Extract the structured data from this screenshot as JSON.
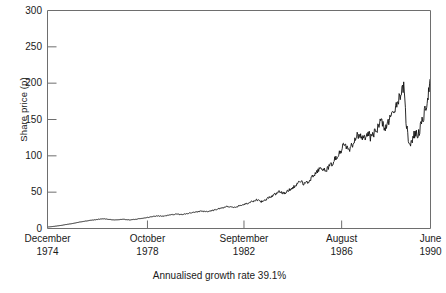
{
  "chart_data": {
    "type": "line",
    "title": "",
    "subtitle": "",
    "xlabel": "",
    "ylabel": "Share price (p)",
    "annotation": "Annualised growth rate 39.1%",
    "grid": false,
    "legend": "none",
    "ylim": [
      0,
      300
    ],
    "yticks": [
      0,
      50,
      100,
      150,
      200,
      250,
      300
    ],
    "ytick_labels": [
      "0",
      "50",
      "100",
      "150",
      "200",
      "250",
      "300"
    ],
    "xlim": [
      "December 1974",
      "June 1990"
    ],
    "xticks": [
      {
        "month": "December",
        "year": "1974",
        "pos": 0.0
      },
      {
        "month": "October",
        "year": "1978",
        "pos": 0.261
      },
      {
        "month": "September",
        "year": "1982",
        "pos": 0.513
      },
      {
        "month": "August",
        "year": "1986",
        "pos": 0.768
      },
      {
        "month": "June",
        "year": "1990",
        "pos": 1.0
      }
    ],
    "series": [
      {
        "name": "Share price",
        "color": "#121212",
        "x": [
          0.0,
          0.006,
          0.012,
          0.018,
          0.024,
          0.03,
          0.036,
          0.042,
          0.048,
          0.054,
          0.06,
          0.066,
          0.072,
          0.078,
          0.084,
          0.09,
          0.096,
          0.102,
          0.108,
          0.114,
          0.12,
          0.126,
          0.132,
          0.138,
          0.144,
          0.15,
          0.156,
          0.162,
          0.168,
          0.174,
          0.18,
          0.186,
          0.192,
          0.198,
          0.204,
          0.21,
          0.216,
          0.222,
          0.228,
          0.234,
          0.24,
          0.246,
          0.252,
          0.258,
          0.264,
          0.27,
          0.276,
          0.282,
          0.288,
          0.294,
          0.3,
          0.306,
          0.312,
          0.318,
          0.324,
          0.33,
          0.336,
          0.342,
          0.348,
          0.354,
          0.36,
          0.366,
          0.372,
          0.378,
          0.384,
          0.39,
          0.396,
          0.402,
          0.408,
          0.414,
          0.42,
          0.426,
          0.432,
          0.438,
          0.444,
          0.45,
          0.456,
          0.462,
          0.468,
          0.474,
          0.48,
          0.486,
          0.492,
          0.498,
          0.504,
          0.51,
          0.516,
          0.522,
          0.528,
          0.534,
          0.54,
          0.546,
          0.552,
          0.558,
          0.564,
          0.57,
          0.576,
          0.582,
          0.588,
          0.594,
          0.6,
          0.606,
          0.612,
          0.618,
          0.624,
          0.63,
          0.636,
          0.642,
          0.648,
          0.654,
          0.66,
          0.666,
          0.672,
          0.678,
          0.684,
          0.69,
          0.696,
          0.702,
          0.708,
          0.714,
          0.72,
          0.726,
          0.732,
          0.738,
          0.744,
          0.75,
          0.756,
          0.762,
          0.768,
          0.774,
          0.78,
          0.786,
          0.792,
          0.798,
          0.804,
          0.81,
          0.816,
          0.822,
          0.828,
          0.834,
          0.84,
          0.846,
          0.852,
          0.858,
          0.864,
          0.87,
          0.876,
          0.882,
          0.888,
          0.894,
          0.9,
          0.906,
          0.912,
          0.918,
          0.924,
          0.93,
          0.936,
          0.942,
          0.948,
          0.954,
          0.96,
          0.966,
          0.972,
          0.978,
          0.984,
          0.99,
          0.995,
          1.0
        ],
        "y": [
          2.0,
          2.3,
          2.6,
          3.0,
          3.4,
          3.9,
          4.3,
          4.8,
          5.4,
          5.9,
          6.4,
          7.0,
          7.6,
          8.2,
          8.9,
          9.4,
          9.9,
          10.4,
          10.9,
          11.3,
          11.7,
          12.1,
          12.6,
          13.0,
          13.4,
          13.2,
          12.8,
          12.4,
          12.1,
          11.9,
          11.8,
          12.0,
          12.3,
          12.6,
          12.4,
          12.1,
          11.9,
          12.2,
          12.6,
          13.0,
          13.4,
          13.8,
          14.3,
          14.9,
          15.4,
          16.0,
          16.6,
          17.0,
          17.4,
          17.1,
          16.8,
          17.2,
          17.8,
          18.4,
          19.0,
          19.5,
          20.0,
          19.6,
          19.1,
          19.4,
          20.0,
          20.6,
          21.2,
          21.8,
          22.4,
          23.0,
          23.6,
          24.2,
          23.6,
          23.0,
          23.5,
          24.2,
          25.0,
          25.8,
          26.6,
          27.4,
          28.2,
          29.0,
          29.8,
          30.5,
          29.6,
          28.8,
          29.6,
          30.6,
          31.6,
          32.6,
          33.6,
          34.6,
          35.6,
          36.8,
          38.0,
          39.2,
          38.0,
          37.0,
          38.4,
          40.0,
          41.8,
          43.6,
          45.4,
          47.2,
          49.2,
          51.2,
          49.6,
          48.2,
          50.0,
          52.2,
          54.6,
          57.0,
          59.6,
          62.2,
          65.0,
          62.8,
          61.0,
          63.6,
          66.6,
          69.8,
          73.2,
          76.8,
          80.6,
          84.6,
          82.0,
          79.0,
          82.4,
          86.4,
          90.6,
          95.0,
          99.6,
          104.4,
          109.4,
          114.6,
          111.0,
          107.0,
          112.0,
          118.0,
          124.0,
          130.0,
          126.0,
          121.0,
          126.0,
          132.0,
          128.0,
          124.0,
          129.0,
          135.0,
          141.0,
          147.0,
          143.0,
          138.0,
          144.0,
          151.0,
          158.0,
          165.0,
          172.0,
          180.0,
          188.0,
          195.0,
          150.0,
          122.0,
          118.0,
          125.0,
          132.0,
          128.0,
          136.0,
          146.0,
          158.0,
          172.0,
          188.0,
          205.0
        ]
      }
    ]
  },
  "yaxis": {
    "title": "Share price (p)"
  },
  "caption": {
    "text": "Annualised growth rate 39.1%"
  }
}
